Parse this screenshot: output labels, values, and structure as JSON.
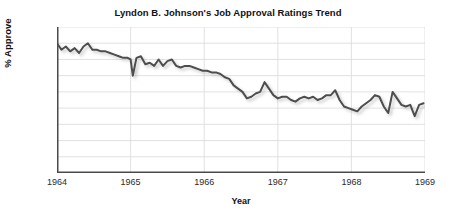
{
  "figure": {
    "title": "Lyndon B. Johnson's Job Approval Ratings Trend",
    "background_color": "#ffffff"
  },
  "axes": {
    "x_title": "Year",
    "y_title": "% Approve",
    "x_tick_labels": [
      "1964",
      "1965",
      "1966",
      "1967",
      "1968",
      "1969"
    ],
    "y_tick_labels": [
      "0",
      "10",
      "20",
      "30",
      "40",
      "50",
      "60",
      "70",
      "80",
      "90"
    ]
  },
  "chart_data": {
    "type": "line",
    "title": "Lyndon B. Johnson's Job Approval Ratings Trend",
    "xlabel": "Year",
    "ylabel": "% Approve",
    "xlim": [
      1964,
      1969
    ],
    "ylim": [
      0,
      90
    ],
    "xticks": [
      1964,
      1965,
      1966,
      1967,
      1968,
      1969
    ],
    "yticks": [
      0,
      10,
      20,
      30,
      40,
      50,
      60,
      70,
      80,
      90
    ],
    "grid": true,
    "legend": "none",
    "line_color": "#4d4d4d",
    "line_width": 2.0,
    "series": [
      {
        "name": "% Approve",
        "x": [
          1964.0,
          1964.06,
          1964.12,
          1964.18,
          1964.24,
          1964.3,
          1964.36,
          1964.42,
          1964.48,
          1964.54,
          1964.6,
          1964.66,
          1964.72,
          1964.78,
          1964.84,
          1964.9,
          1964.96,
          1965.0,
          1965.03,
          1965.08,
          1965.14,
          1965.2,
          1965.26,
          1965.32,
          1965.38,
          1965.44,
          1965.5,
          1965.56,
          1965.62,
          1965.68,
          1965.74,
          1965.8,
          1965.86,
          1965.92,
          1965.98,
          1966.04,
          1966.1,
          1966.16,
          1966.22,
          1966.28,
          1966.34,
          1966.4,
          1966.46,
          1966.52,
          1966.58,
          1966.64,
          1966.7,
          1966.76,
          1966.82,
          1966.88,
          1966.94,
          1967.0,
          1967.06,
          1967.12,
          1967.18,
          1967.24,
          1967.3,
          1967.36,
          1967.42,
          1967.48,
          1967.54,
          1967.6,
          1967.66,
          1967.72,
          1967.78,
          1967.84,
          1967.9,
          1967.96,
          1968.02,
          1968.08,
          1968.14,
          1968.2,
          1968.26,
          1968.32,
          1968.38,
          1968.44,
          1968.5,
          1968.56,
          1968.62,
          1968.68,
          1968.74,
          1968.8,
          1968.86,
          1968.92,
          1968.98
        ],
        "y": [
          80,
          76,
          78,
          75,
          77,
          74,
          78,
          80,
          76,
          76,
          75,
          75,
          74,
          73,
          72,
          71,
          71,
          70,
          60,
          71,
          72,
          67,
          68,
          66,
          70,
          66,
          69,
          70,
          66,
          65,
          66,
          66,
          65,
          64,
          63,
          63,
          62,
          62,
          61,
          59,
          58,
          54,
          52,
          50,
          46,
          47,
          49,
          50,
          56,
          52,
          48,
          46,
          47,
          47,
          45,
          44,
          46,
          47,
          46,
          47,
          45,
          46,
          48,
          48,
          51,
          45,
          41,
          40,
          39,
          38,
          41,
          43,
          45,
          48,
          47,
          41,
          37,
          50,
          46,
          42,
          41,
          42,
          35,
          42,
          43
        ]
      }
    ]
  }
}
